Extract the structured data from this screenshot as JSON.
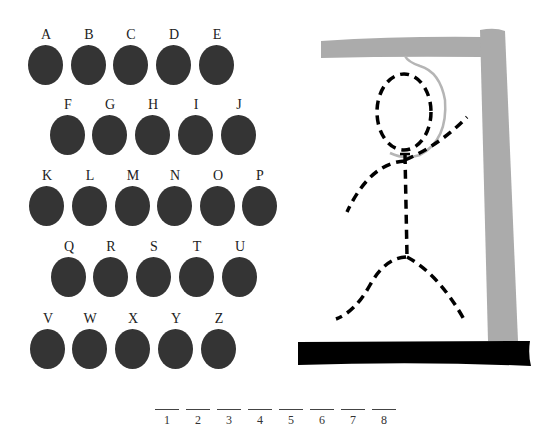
{
  "letters": {
    "rows": [
      [
        "A",
        "B",
        "C",
        "D",
        "E"
      ],
      [
        "F",
        "G",
        "H",
        "I",
        "J"
      ],
      [
        "K",
        "L",
        "M",
        "N",
        "O",
        "P"
      ],
      [
        "Q",
        "R",
        "S",
        "T",
        "U"
      ],
      [
        "V",
        "W",
        "X",
        "Y",
        "Z"
      ]
    ]
  },
  "colors": {
    "letter_disc": "#343434",
    "gallows": "#ababab",
    "base": "#000000",
    "rope": "#b5b5b5",
    "figure": "#000000"
  },
  "word_blanks": [
    "1",
    "2",
    "3",
    "4",
    "5",
    "6",
    "7",
    "8"
  ],
  "hangman": {
    "parts": [
      "head",
      "body",
      "left-arm",
      "right-arm",
      "left-leg",
      "right-leg"
    ]
  }
}
